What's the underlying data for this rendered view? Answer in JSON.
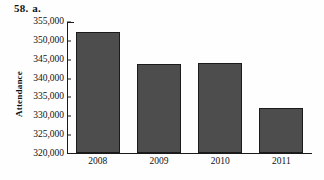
{
  "problem": {
    "number": "58.",
    "part": "a."
  },
  "chart_data": {
    "type": "bar",
    "title": "",
    "xlabel": "",
    "ylabel": "Attendance",
    "categories": [
      "2008",
      "2009",
      "2010",
      "2011"
    ],
    "values": [
      352200,
      343500,
      344000,
      332000
    ],
    "ylim": [
      320000,
      355000
    ],
    "yticks": [
      320000,
      325000,
      330000,
      335000,
      340000,
      345000,
      350000,
      355000
    ],
    "ytick_labels": [
      "320,000",
      "325,000",
      "330,000",
      "335,000",
      "340,000",
      "345,000",
      "350,000",
      "355,000"
    ],
    "grid": false,
    "legend": false,
    "bar_color": "#4d4d4d",
    "bar_edge_color": "#1b1b1b",
    "axis_color": "#1a1a1a"
  }
}
